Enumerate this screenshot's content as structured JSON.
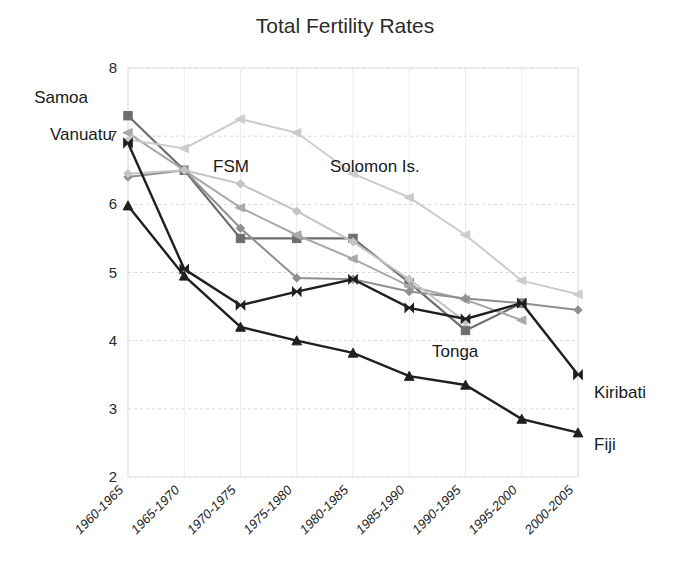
{
  "chart_data": {
    "type": "line",
    "title": "Total Fertility Rates",
    "xlabel": "",
    "ylabel": "",
    "ylim": [
      2,
      8
    ],
    "ytick_values": [
      2,
      3,
      4,
      5,
      6,
      7,
      8
    ],
    "ytick_labels": [
      "2",
      "3",
      "4",
      "5",
      "6",
      "7",
      "8"
    ],
    "grid": true,
    "legend_position": "inline-annotations",
    "categories": [
      "1960-1965",
      "1965-1970",
      "1970-1975",
      "1975-1980",
      "1980-1985",
      "1985-1990",
      "1990-1995",
      "1995-2000",
      "2000-2005"
    ],
    "series": [
      {
        "name": "Samoa",
        "color": "#6e6e6e",
        "marker": "square",
        "width": 2.2,
        "values": [
          7.3,
          6.5,
          5.5,
          5.5,
          5.5,
          4.85,
          4.15,
          4.55,
          null
        ]
      },
      {
        "name": "Vanuatu",
        "color": "#a8a8a8",
        "marker": "triangle-left",
        "width": 2.0,
        "values": [
          7.05,
          6.5,
          5.95,
          5.55,
          5.2,
          4.8,
          4.6,
          4.3,
          null
        ]
      },
      {
        "name": "FSM",
        "color": "#8f8f8f",
        "marker": "diamond",
        "width": 2.0,
        "values": [
          6.4,
          6.5,
          5.65,
          4.92,
          4.9,
          4.72,
          4.62,
          4.55,
          4.45
        ]
      },
      {
        "name": "Solomon Is.",
        "color": "#cccccc",
        "marker": "triangle-left",
        "width": 2.0,
        "values": [
          6.95,
          6.82,
          7.25,
          7.05,
          6.45,
          6.1,
          5.55,
          4.88,
          4.68
        ]
      },
      {
        "name": "Tonga",
        "color": "#c4c4c4",
        "marker": "diamond",
        "width": 2.0,
        "values": [
          6.45,
          6.5,
          6.3,
          5.9,
          5.45,
          4.9,
          4.28,
          null,
          null
        ]
      },
      {
        "name": "Kiribati",
        "color": "#1f1f1f",
        "marker": "bowtie",
        "width": 2.4,
        "values": [
          6.9,
          5.05,
          4.52,
          4.72,
          4.9,
          4.48,
          4.32,
          4.55,
          3.5
        ]
      },
      {
        "name": "Fiji",
        "color": "#1f1f1f",
        "marker": "triangle-up",
        "width": 2.4,
        "values": [
          5.98,
          4.95,
          4.2,
          4.0,
          3.82,
          3.48,
          3.35,
          2.85,
          2.65
        ]
      }
    ],
    "annotations": [
      {
        "name": "Samoa",
        "text": "Samoa",
        "x": 88,
        "y": 103,
        "anchor": "end"
      },
      {
        "name": "Vanuatu",
        "text": "Vanuatu",
        "x": 112,
        "y": 140,
        "anchor": "end"
      },
      {
        "name": "FSM",
        "text": "FSM",
        "x": 213,
        "y": 172,
        "anchor": "start"
      },
      {
        "name": "Solomon Is.",
        "text": "Solomon Is.",
        "x": 330,
        "y": 172,
        "anchor": "start"
      },
      {
        "name": "Tonga",
        "text": "Tonga",
        "x": 432,
        "y": 357,
        "anchor": "start"
      },
      {
        "name": "Kiribati",
        "text": "Kiribati",
        "x": 594,
        "y": 398,
        "anchor": "start"
      },
      {
        "name": "Fiji",
        "text": "Fiji",
        "x": 594,
        "y": 450,
        "anchor": "start"
      }
    ]
  }
}
